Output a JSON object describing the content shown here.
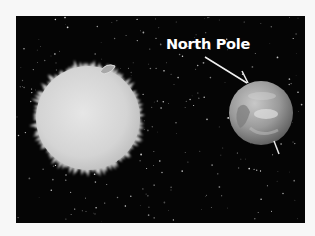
{
  "diagram": {
    "label": "North Pole",
    "colors": {
      "page_background": "#f7f7f7",
      "space": "#050505",
      "sun": "#d9d9d9",
      "earth": "#9a9a9a",
      "label": "#ffffff",
      "axis_line": "#e8e8e8"
    },
    "elements": {
      "sun": {
        "cx": 88,
        "cy": 118,
        "r": 55
      },
      "earth": {
        "cx": 261,
        "cy": 113,
        "r": 32
      },
      "axis_top": {
        "x1": 242,
        "y1": 71,
        "x2": 248,
        "y2": 83
      },
      "axis_bottom": {
        "x1": 274,
        "y1": 141,
        "x2": 279,
        "y2": 154
      },
      "pointer": {
        "x1": 205,
        "y1": 57,
        "x2": 247,
        "y2": 83
      }
    }
  }
}
